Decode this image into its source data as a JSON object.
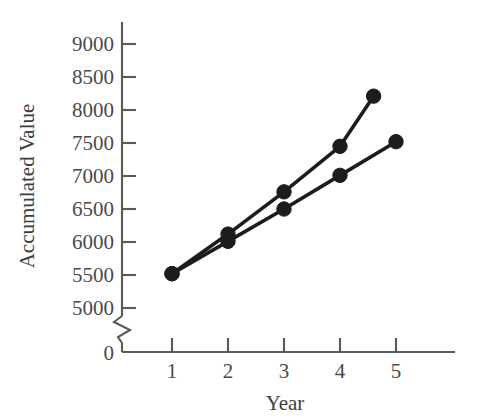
{
  "chart_data": {
    "type": "line",
    "title": "",
    "xlabel": "Year",
    "ylabel": "Accumulated Value",
    "xlim": [
      0,
      5.9
    ],
    "ylim": [
      5000,
      9000
    ],
    "grid": false,
    "legend": "none",
    "axis_break": {
      "present": true,
      "axis": "y",
      "between": [
        0,
        5000
      ],
      "symbol": "zigzag"
    },
    "x_ticks": [
      1,
      2,
      3,
      4,
      5
    ],
    "x_tick_labels": [
      "1",
      "2",
      "3",
      "4",
      "5"
    ],
    "x_origin_label": "0",
    "y_ticks": [
      5000,
      5500,
      6000,
      6500,
      7000,
      7500,
      8000,
      8500,
      9000
    ],
    "y_tick_labels": [
      "5000",
      "5500",
      "6000",
      "6500",
      "7000",
      "7500",
      "8000",
      "8500",
      "9000"
    ],
    "series": [
      {
        "name": "upper-series",
        "marker": "filled-circle",
        "color": "#1c1c1c",
        "x": [
          1,
          2,
          3,
          4,
          4.6
        ],
        "values": [
          5520,
          6120,
          6760,
          7450,
          8210
        ]
      },
      {
        "name": "lower-series",
        "marker": "filled-circle",
        "color": "#1c1c1c",
        "x": [
          1,
          2,
          3,
          4,
          5
        ],
        "values": [
          5520,
          6010,
          6500,
          7010,
          7520
        ]
      }
    ]
  },
  "axes": {
    "y_label_text": "Accumulated Value",
    "x_label_text": "Year",
    "origin_text": "0"
  },
  "colors": {
    "line": "#1c1c1c",
    "marker": "#1c1c1c",
    "axis": "#5a5a5a",
    "text": "#4a4a4a",
    "background": "#ffffff"
  }
}
